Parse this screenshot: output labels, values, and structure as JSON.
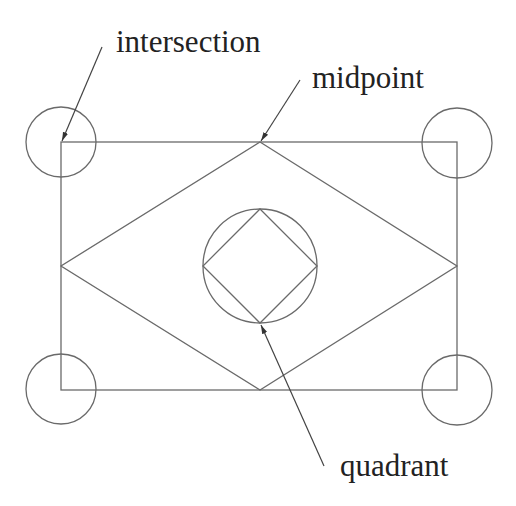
{
  "diagram": {
    "type": "geometry-snap-points",
    "colors": {
      "line": "#6a6a6a",
      "text": "#222222",
      "background": "#ffffff"
    },
    "labels": {
      "intersection": "intersection",
      "midpoint": "midpoint",
      "quadrant": "quadrant"
    },
    "shapes": {
      "rectangle": {
        "x": 61,
        "y": 142,
        "width": 396,
        "height": 248
      },
      "outer_diamond": {
        "points": "260,142 457,266 260,390 61,266"
      },
      "inner_circle": {
        "cx": 260,
        "cy": 266,
        "r": 57
      },
      "inner_diamond": {
        "points": "260,209 317,266 260,323 203,266"
      },
      "corner_circles": [
        {
          "cx": 61,
          "cy": 142,
          "r": 35
        },
        {
          "cx": 457,
          "cy": 143,
          "r": 35
        },
        {
          "cx": 61,
          "cy": 389,
          "r": 35
        },
        {
          "cx": 457,
          "cy": 390,
          "r": 35
        }
      ]
    },
    "annotations": [
      {
        "label": "intersection",
        "from": [
          102,
          47
        ],
        "to": [
          62,
          141
        ]
      },
      {
        "label": "midpoint",
        "from": [
          300,
          80
        ],
        "to": [
          261,
          141
        ]
      },
      {
        "label": "quadrant",
        "from": [
          324,
          466
        ],
        "to": [
          261,
          325
        ]
      }
    ]
  }
}
